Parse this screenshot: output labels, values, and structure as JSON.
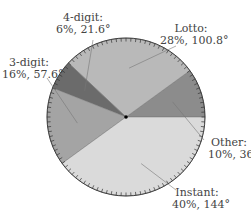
{
  "chart_data": {
    "type": "pie",
    "title": "",
    "start_angle_deg": 0,
    "direction": "counterclockwise",
    "slices": [
      {
        "name": "Other",
        "percent": 10,
        "degrees": 36,
        "label": "Other:",
        "value_label": "10%, 36°",
        "color": "#8c8c8c"
      },
      {
        "name": "Lotto",
        "percent": 28,
        "degrees": 100.8,
        "label": "Lotto:",
        "value_label": "28%, 100.8°",
        "color": "#b9b9b9"
      },
      {
        "name": "4-digit",
        "percent": 6,
        "degrees": 21.6,
        "label": "4-digit:",
        "value_label": "6%, 21.6°",
        "color": "#6b6b6b"
      },
      {
        "name": "3-digit",
        "percent": 16,
        "degrees": 57.6,
        "label": "3-digit:",
        "value_label": "16%, 57.6°",
        "color": "#a4a4a4"
      },
      {
        "name": "Instant",
        "percent": 40,
        "degrees": 144,
        "label": "Instant:",
        "value_label": "40%, 144°",
        "color": "#dadada"
      }
    ],
    "tick_marks_on_rim": true,
    "tick_count": 100,
    "legend": "none"
  },
  "labels": {
    "other": {
      "line1": "Other:",
      "line2": "10%, 36°"
    },
    "lotto": {
      "line1": "Lotto:",
      "line2": "28%, 100.8°"
    },
    "four_digit": {
      "line1": "4-digit:",
      "line2": "6%, 21.6°"
    },
    "three_digit": {
      "line1": "3-digit:",
      "line2": "16%, 57.6°"
    },
    "instant": {
      "line1": "Instant:",
      "line2": "40%, 144°"
    }
  }
}
